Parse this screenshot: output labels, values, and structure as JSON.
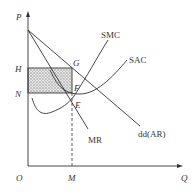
{
  "diagram": {
    "type": "monopoly short-run equilibrium (profit)",
    "axes": {
      "y_label": "P",
      "x_label": "Q",
      "origin_label": "O"
    },
    "price_labels": {
      "H": "H",
      "N": "N"
    },
    "quantity_labels": {
      "M": "M"
    },
    "points": {
      "G": "G",
      "F": "F",
      "E": "E"
    },
    "curves": {
      "smc": "SMC",
      "sac": "SAC",
      "mr": "MR",
      "demand": "dd(AR)"
    },
    "shaded_region": "profit rectangle HGFN",
    "colors": {
      "line": "#333333",
      "shade": "#cfcfcf"
    }
  }
}
